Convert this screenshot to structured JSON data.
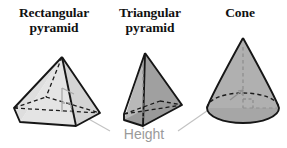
{
  "figure": {
    "type": "geometry-diagram",
    "background_color": "#ffffff",
    "shapes": [
      {
        "name": "rectangular-pyramid",
        "title_line1": "Rectangular",
        "title_line2": "pyramid",
        "face_light_color": "#e2e2e2",
        "face_dark_color": "#c9c9c9",
        "edge_color": "#1a1a1a",
        "hidden_edge_style": "dashed",
        "height_line_color": "#a8a8a8",
        "has_right_angle_marker": true
      },
      {
        "name": "triangular-pyramid",
        "title_line1": "Triangular",
        "title_line2": "pyramid",
        "face_light_color": "#b4b4b4",
        "face_dark_color": "#9e9e9e",
        "edge_color": "#1a1a1a",
        "hidden_edge_style": "dashed",
        "height_line_color": "#a8a8a8",
        "has_right_angle_marker": false
      },
      {
        "name": "cone",
        "title_line1": "Cone",
        "title_line2": "",
        "face_light_color": "#b0b0b0",
        "face_dark_color": "#a3a3a3",
        "edge_color": "#1a1a1a",
        "hidden_edge_style": "dashed",
        "height_line_color": "#8f8f8f",
        "has_right_angle_marker": true
      }
    ],
    "callout": {
      "label": "Height",
      "label_color": "#9a9a9a",
      "leader_line_color": "#bdbdbd",
      "leader_targets": [
        "rectangular-pyramid",
        "triangular-pyramid",
        "cone"
      ]
    }
  }
}
